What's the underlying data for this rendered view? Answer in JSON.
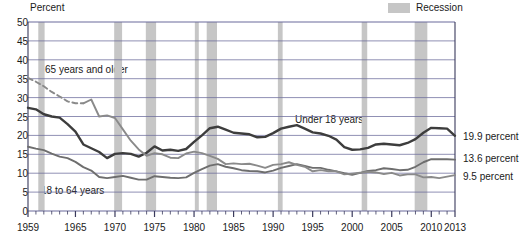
{
  "axis_title": "Percent",
  "legend": {
    "swatch_label": "Recession",
    "swatch_color": "#c6c6c6"
  },
  "colors": {
    "under18": "#3d3d3d",
    "age18to64": "#6e6e6e",
    "age65plus": "#8a8a8a",
    "grid": "#6b6b9b",
    "frame": "#3a3a5c"
  },
  "annotations": {
    "under18": "Under 18 years",
    "age65plus": "65 years and older",
    "age18to64": "18 to 64 years"
  },
  "end_labels": {
    "under18": "19.9 percent",
    "age18to64": "13.6 percent",
    "age65plus": "9.5 percent"
  },
  "chart_data": {
    "type": "line",
    "title": "",
    "xlabel": "",
    "ylabel": "Percent",
    "xlim": [
      1959,
      2013
    ],
    "ylim": [
      0,
      50
    ],
    "yticks": [
      0,
      5,
      10,
      15,
      20,
      25,
      30,
      35,
      40,
      45,
      50
    ],
    "xticks": [
      1959,
      1965,
      1970,
      1975,
      1980,
      1985,
      1990,
      1995,
      2000,
      2005,
      2010,
      2013
    ],
    "xtick_labels": [
      "1959",
      "1965",
      "1970",
      "1975",
      "1980",
      "1985",
      "1990",
      "1995",
      "2000",
      "2005",
      "2010",
      "2013"
    ],
    "grid": true,
    "legend_position": "top-right",
    "minor_tick_years_every": 1,
    "recessions": [
      [
        1960.3,
        1961.1
      ],
      [
        1969.9,
        1970.9
      ],
      [
        1973.9,
        1975.2
      ],
      [
        1980.1,
        1980.6
      ],
      [
        1981.6,
        1982.9
      ],
      [
        1990.6,
        1991.2
      ],
      [
        2001.2,
        2001.9
      ],
      [
        2007.9,
        2009.5
      ]
    ],
    "series": [
      {
        "name": "Under 18 years",
        "color": "#3d3d3d",
        "end_value": 19.9,
        "x": [
          1959,
          1960,
          1961,
          1962,
          1963,
          1964,
          1965,
          1966,
          1967,
          1968,
          1969,
          1970,
          1971,
          1972,
          1973,
          1974,
          1975,
          1976,
          1977,
          1978,
          1979,
          1980,
          1981,
          1982,
          1983,
          1984,
          1985,
          1986,
          1987,
          1988,
          1989,
          1990,
          1991,
          1992,
          1993,
          1994,
          1995,
          1996,
          1997,
          1998,
          1999,
          2000,
          2001,
          2002,
          2003,
          2004,
          2005,
          2006,
          2007,
          2008,
          2009,
          2010,
          2011,
          2012,
          2013
        ],
        "values": [
          27.3,
          26.9,
          25.6,
          25.0,
          24.7,
          23.0,
          21.0,
          17.6,
          16.6,
          15.6,
          14.0,
          15.1,
          15.3,
          15.1,
          14.4,
          15.4,
          17.1,
          16.0,
          16.2,
          15.9,
          16.4,
          18.3,
          20.0,
          21.9,
          22.3,
          21.5,
          20.7,
          20.5,
          20.3,
          19.5,
          19.6,
          20.6,
          21.8,
          22.3,
          22.7,
          21.8,
          20.8,
          20.5,
          19.9,
          18.9,
          16.9,
          16.2,
          16.3,
          16.7,
          17.6,
          17.8,
          17.6,
          17.4,
          18.0,
          19.0,
          20.7,
          22.0,
          21.9,
          21.8,
          19.9
        ]
      },
      {
        "name": "18 to 64 years",
        "color": "#6e6e6e",
        "end_value": 13.6,
        "x": [
          1959,
          1960,
          1961,
          1962,
          1963,
          1964,
          1965,
          1966,
          1967,
          1968,
          1969,
          1970,
          1971,
          1972,
          1973,
          1974,
          1975,
          1976,
          1977,
          1978,
          1979,
          1980,
          1981,
          1982,
          1983,
          1984,
          1985,
          1986,
          1987,
          1988,
          1989,
          1990,
          1991,
          1992,
          1993,
          1994,
          1995,
          1996,
          1997,
          1998,
          1999,
          2000,
          2001,
          2002,
          2003,
          2004,
          2005,
          2006,
          2007,
          2008,
          2009,
          2010,
          2011,
          2012,
          2013
        ],
        "values": [
          17.0,
          16.5,
          16.1,
          15.2,
          14.4,
          14.0,
          13.0,
          11.6,
          10.7,
          9.0,
          8.7,
          9.0,
          9.3,
          8.8,
          8.3,
          8.3,
          9.2,
          9.0,
          8.8,
          8.7,
          8.9,
          10.1,
          11.1,
          12.0,
          12.4,
          11.7,
          11.3,
          10.8,
          10.6,
          10.5,
          10.2,
          10.7,
          11.4,
          11.9,
          12.4,
          11.9,
          11.4,
          11.4,
          10.9,
          10.5,
          10.0,
          9.6,
          10.1,
          10.6,
          10.8,
          11.3,
          11.1,
          10.8,
          10.9,
          11.7,
          12.9,
          13.7,
          13.7,
          13.7,
          13.6
        ]
      },
      {
        "name": "65 years and older",
        "color": "#8a8a8a",
        "end_value": 9.5,
        "dashed_through": 1966,
        "x": [
          1959,
          1960,
          1961,
          1962,
          1963,
          1964,
          1965,
          1966,
          1967,
          1968,
          1969,
          1970,
          1971,
          1972,
          1973,
          1974,
          1975,
          1976,
          1977,
          1978,
          1979,
          1980,
          1981,
          1982,
          1983,
          1984,
          1985,
          1986,
          1987,
          1988,
          1989,
          1990,
          1991,
          1992,
          1993,
          1994,
          1995,
          1996,
          1997,
          1998,
          1999,
          2000,
          2001,
          2002,
          2003,
          2004,
          2005,
          2006,
          2007,
          2008,
          2009,
          2010,
          2011,
          2012,
          2013
        ],
        "values": [
          35.2,
          34.2,
          33.0,
          31.5,
          30.3,
          29.0,
          28.5,
          28.5,
          29.5,
          25.0,
          25.3,
          24.6,
          21.6,
          18.6,
          16.3,
          14.6,
          15.3,
          15.0,
          14.1,
          14.0,
          15.2,
          15.7,
          15.3,
          14.6,
          13.8,
          12.4,
          12.6,
          12.4,
          12.5,
          12.0,
          11.4,
          12.2,
          12.4,
          12.9,
          12.2,
          11.7,
          10.5,
          10.8,
          10.5,
          10.5,
          9.7,
          9.9,
          10.1,
          10.4,
          10.2,
          9.8,
          10.1,
          9.4,
          9.7,
          9.7,
          8.9,
          9.0,
          8.7,
          9.1,
          9.5
        ]
      }
    ]
  }
}
